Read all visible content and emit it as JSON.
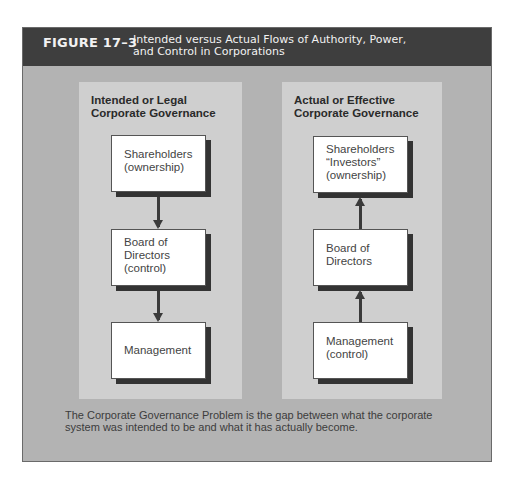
{
  "figure": {
    "label": "FIGURE 17–3",
    "title_line1": "Intended versus Actual Flows of Authority, Power,",
    "title_line2": "and Control in Corporations"
  },
  "panels": {
    "intended": {
      "title_line1": "Intended or Legal",
      "title_line2": "Corporate Governance",
      "flow_direction": "down",
      "boxes": [
        {
          "lines": [
            "Shareholders",
            "(ownership)"
          ]
        },
        {
          "lines": [
            "Board of",
            "Directors",
            "(control)"
          ]
        },
        {
          "lines": [
            "Management"
          ]
        }
      ]
    },
    "actual": {
      "title_line1": "Actual or Effective",
      "title_line2": "Corporate Governance",
      "flow_direction": "up",
      "boxes": [
        {
          "lines": [
            "Shareholders",
            "“Investors”",
            "(ownership)"
          ]
        },
        {
          "lines": [
            "Board of",
            "Directors"
          ]
        },
        {
          "lines": [
            "Management",
            "(control)"
          ]
        }
      ]
    }
  },
  "caption": {
    "line1": "The Corporate Governance Problem is the gap between what the corporate",
    "line2": "system was intended to be and what it has actually become."
  },
  "colors": {
    "header_bg": "#3e3e3e",
    "figure_bg": "#b3b3b3",
    "panel_bg": "#cfcfcf",
    "box_shadow": "#333333"
  }
}
